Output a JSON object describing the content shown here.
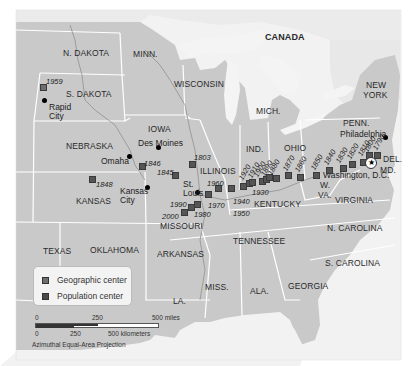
{
  "map": {
    "title_region": "CANADA",
    "colors": {
      "land_us": "#c9c9c9",
      "land_canada": "#ececec",
      "water": "#f4f4f4",
      "borders": "#ffffff",
      "rivers": "#8a8a8a",
      "geo_marker": "#6e6e6e",
      "pop_marker": "#555555"
    },
    "states": [
      {
        "name": "N. DAKOTA",
        "x": 63,
        "y": 49
      },
      {
        "name": "MINN.",
        "x": 133,
        "y": 50
      },
      {
        "name": "S. DAKOTA",
        "x": 66,
        "y": 90
      },
      {
        "name": "WISCONSIN",
        "x": 174,
        "y": 80
      },
      {
        "name": "MICH.",
        "x": 256,
        "y": 107
      },
      {
        "name": "IOWA",
        "x": 148,
        "y": 125
      },
      {
        "name": "NEBRASKA",
        "x": 66,
        "y": 142
      },
      {
        "name": "ILLINOIS",
        "x": 200,
        "y": 167
      },
      {
        "name": "IND.",
        "x": 246,
        "y": 145
      },
      {
        "name": "OHIO",
        "x": 284,
        "y": 144
      },
      {
        "name": "PENN.",
        "x": 343,
        "y": 119
      },
      {
        "name": "NEW",
        "x": 366,
        "y": 81
      },
      {
        "name": "YORK",
        "x": 363,
        "y": 91
      },
      {
        "name": "KANSAS",
        "x": 76,
        "y": 197
      },
      {
        "name": "MISSOURI",
        "x": 160,
        "y": 222
      },
      {
        "name": "KENTUCKY",
        "x": 254,
        "y": 200
      },
      {
        "name": "W.",
        "x": 320,
        "y": 181
      },
      {
        "name": "VA.",
        "x": 318,
        "y": 191
      },
      {
        "name": "VIRGINIA",
        "x": 335,
        "y": 196
      },
      {
        "name": "DEL.",
        "x": 383,
        "y": 155
      },
      {
        "name": "MD.",
        "x": 380,
        "y": 166
      },
      {
        "name": "TEXAS",
        "x": 43,
        "y": 247
      },
      {
        "name": "OKLAHOMA",
        "x": 90,
        "y": 246
      },
      {
        "name": "ARKANSAS",
        "x": 157,
        "y": 250
      },
      {
        "name": "TENNESSEE",
        "x": 233,
        "y": 237
      },
      {
        "name": "N. CAROLINA",
        "x": 327,
        "y": 224
      },
      {
        "name": "S. CAROLINA",
        "x": 325,
        "y": 259
      },
      {
        "name": "GEORGIA",
        "x": 288,
        "y": 282
      },
      {
        "name": "MISS.",
        "x": 205,
        "y": 283
      },
      {
        "name": "ALA.",
        "x": 250,
        "y": 287
      },
      {
        "name": "LA.",
        "x": 173,
        "y": 297
      }
    ],
    "cities": [
      {
        "name": "Rapid\nCity",
        "x": 49,
        "y": 103,
        "dot_x": 44,
        "dot_y": 100
      },
      {
        "name": "Des Moines",
        "x": 138,
        "y": 139,
        "dot_x": 158,
        "dot_y": 147
      },
      {
        "name": "Omaha",
        "x": 101,
        "y": 157,
        "dot_x": 129,
        "dot_y": 156
      },
      {
        "name": "Kansas\nCity",
        "x": 120,
        "y": 187,
        "dot_x": 147,
        "dot_y": 187
      },
      {
        "name": "St.\nLouis",
        "x": 183,
        "y": 180,
        "dot_x": 197,
        "dot_y": 192
      },
      {
        "name": "Philadelphia",
        "x": 340,
        "y": 130,
        "dot_x": 385,
        "dot_y": 137
      },
      {
        "name": "Washington, D.C.",
        "x": 323,
        "y": 171,
        "dot_x": 369,
        "dot_y": 162
      }
    ],
    "markers": [
      {
        "year": "1959",
        "type": "geo",
        "x": 40,
        "y": 84,
        "lx": 46,
        "ly": 78,
        "rot": false
      },
      {
        "year": "1848",
        "type": "pop",
        "x": 89,
        "y": 176,
        "lx": 96,
        "ly": 181,
        "rot": false
      },
      {
        "year": "1846",
        "type": "pop",
        "x": 139,
        "y": 163,
        "lx": 144,
        "ly": 160,
        "rot": false
      },
      {
        "year": "1845",
        "type": "pop",
        "x": 172,
        "y": 172,
        "lx": 157,
        "ly": 169,
        "rot": false
      },
      {
        "year": "1803",
        "type": "pop",
        "x": 189,
        "y": 161,
        "lx": 194,
        "ly": 154,
        "rot": false
      },
      {
        "year": "1990",
        "type": "pop",
        "x": 188,
        "y": 204,
        "lx": 170,
        "ly": 201,
        "rot": false
      },
      {
        "year": "2000",
        "type": "pop",
        "x": 181,
        "y": 209,
        "lx": 162,
        "ly": 213,
        "rot": false
      },
      {
        "year": "1980",
        "type": "pop",
        "x": 194,
        "y": 201,
        "lx": 194,
        "ly": 211,
        "rot": false
      },
      {
        "year": "1970",
        "type": "pop",
        "x": 205,
        "y": 191,
        "lx": 208,
        "ly": 202,
        "rot": false
      },
      {
        "year": "1960",
        "type": "pop",
        "x": 215,
        "y": 185,
        "lx": 207,
        "ly": 180,
        "rot": false
      },
      {
        "year": "1950",
        "type": "pop",
        "x": 228,
        "y": 185,
        "lx": 233,
        "ly": 210,
        "rot": false
      },
      {
        "year": "1940",
        "type": "pop",
        "x": 240,
        "y": 183,
        "lx": 233,
        "ly": 198,
        "rot": false
      },
      {
        "year": "1930",
        "type": "pop",
        "x": 246,
        "y": 180,
        "lx": 252,
        "ly": 189,
        "rot": false
      },
      {
        "year": "1920",
        "type": "pop",
        "x": 249,
        "y": 179,
        "lx": 244,
        "ly": 174,
        "rot": true
      },
      {
        "year": "1910",
        "type": "pop",
        "x": 259,
        "y": 178,
        "lx": 253,
        "ly": 172,
        "rot": true
      },
      {
        "year": "1900",
        "type": "pop",
        "x": 263,
        "y": 176,
        "lx": 259,
        "ly": 171,
        "rot": true
      },
      {
        "year": "1890",
        "type": "pop",
        "x": 266,
        "y": 174,
        "lx": 266,
        "ly": 170,
        "rot": true
      },
      {
        "year": "1880",
        "type": "pop",
        "x": 273,
        "y": 175,
        "lx": 273,
        "ly": 169,
        "rot": true
      },
      {
        "year": "1870",
        "type": "pop",
        "x": 285,
        "y": 172,
        "lx": 288,
        "ly": 165,
        "rot": true
      },
      {
        "year": "1860",
        "type": "pop",
        "x": 297,
        "y": 174,
        "lx": 300,
        "ly": 166,
        "rot": true
      },
      {
        "year": "1850",
        "type": "pop",
        "x": 313,
        "y": 172,
        "lx": 316,
        "ly": 164,
        "rot": true
      },
      {
        "year": "1840",
        "type": "pop",
        "x": 326,
        "y": 167,
        "lx": 329,
        "ly": 159,
        "rot": true
      },
      {
        "year": "1830",
        "type": "pop",
        "x": 340,
        "y": 165,
        "lx": 341,
        "ly": 157,
        "rot": true
      },
      {
        "year": "1820",
        "type": "pop",
        "x": 349,
        "y": 161,
        "lx": 352,
        "ly": 153,
        "rot": true
      },
      {
        "year": "1810",
        "type": "pop",
        "x": 360,
        "y": 159,
        "lx": 363,
        "ly": 150,
        "rot": true
      },
      {
        "year": "1800",
        "type": "pop",
        "x": 366,
        "y": 152,
        "lx": 369,
        "ly": 146,
        "rot": true
      },
      {
        "year": "1790",
        "type": "pop",
        "x": 374,
        "y": 152,
        "lx": 378,
        "ly": 144,
        "rot": true
      }
    ]
  },
  "legend": {
    "items": [
      {
        "label": "Geographic center",
        "color": "#6e6e6e"
      },
      {
        "label": "Population center",
        "color": "#4a4a4a"
      }
    ]
  },
  "scale": {
    "miles": {
      "ticks": [
        "0",
        "250",
        "500 miles"
      ]
    },
    "km": {
      "ticks": [
        "0",
        "250",
        "500 kilometers"
      ]
    },
    "projection": "Azimuthal Equal-Area Projection"
  }
}
